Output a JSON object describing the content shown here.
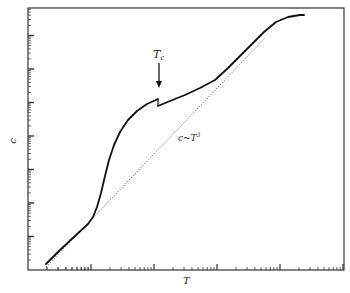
{
  "chart_data": {
    "type": "line",
    "title": "",
    "xlabel": "T",
    "ylabel": "c",
    "xscale": "log",
    "yscale": "log",
    "x_major_ticks_decades": 4,
    "y_major_ticks_decades": 7,
    "tick_labels_shown": false,
    "grid": false,
    "legend": null,
    "annotations": [
      {
        "text": "T_c",
        "display": "Tc",
        "type": "arrow-label",
        "note": "arrow pointing down to discontinuity"
      },
      {
        "text": "c~T^3",
        "display_base": "c~T",
        "display_sup": "3",
        "type": "curve-label"
      }
    ],
    "series": [
      {
        "name": "c(T)",
        "style": "solid",
        "color": "#111111",
        "segments": [
          {
            "points_px": [
              [
                46,
                264
              ],
              [
                60,
                250
              ],
              [
                75,
                236
              ],
              [
                88,
                224
              ],
              [
                93,
                217
              ],
              [
                97,
                207
              ],
              [
                101,
                193
              ],
              [
                105,
                176
              ],
              [
                109,
                160
              ],
              [
                114,
                145
              ],
              [
                120,
                132
              ],
              [
                128,
                120
              ],
              [
                137,
                111
              ],
              [
                147,
                104
              ],
              [
                158,
                99
              ]
            ]
          },
          {
            "points_px": [
              [
                158,
                106
              ],
              [
                170,
                101
              ],
              [
                185,
                95
              ],
              [
                200,
                88
              ],
              [
                215,
                80
              ],
              [
                228,
                68
              ],
              [
                240,
                56
              ],
              [
                252,
                44
              ],
              [
                264,
                32
              ],
              [
                276,
                22
              ],
              [
                288,
                17
              ],
              [
                300,
                15
              ],
              [
                304,
                15
              ]
            ]
          }
        ]
      },
      {
        "name": "c~T^3",
        "style": "dotted",
        "color": "#555555",
        "points_px": [
          [
            46,
            267
          ],
          [
            265,
            38
          ]
        ]
      }
    ],
    "discontinuity": {
      "at": "Tc",
      "x_px": 158,
      "y_before_px": 99,
      "y_after_px": 106
    }
  },
  "labels": {
    "xlabel": "T",
    "ylabel": "c",
    "tc_base": "T",
    "tc_sub": "c",
    "cubic_base": "c~T",
    "cubic_sup": "3"
  }
}
